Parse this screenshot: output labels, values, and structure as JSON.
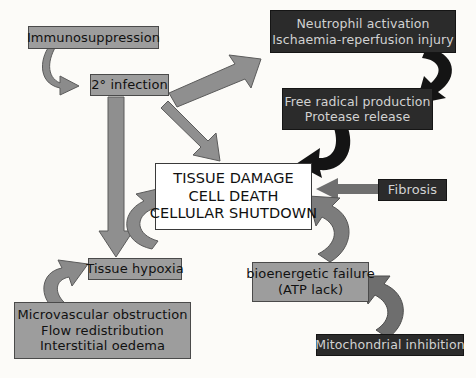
{
  "diagram": {
    "colors": {
      "grey_fill": "#9d9d9d",
      "grey_stroke": "#4a4a4a",
      "dark_fill": "#2b2b2b",
      "dark_text": "#d2d2d2",
      "white_fill": "#ffffff",
      "black_arrow": "#1a1a1a",
      "grey_arrow": "#8f8f8f",
      "page_background": "#fcfbf8"
    },
    "nodes": [
      {
        "id": "immunosuppression",
        "style": "grey",
        "lines": [
          "Immunosuppression"
        ]
      },
      {
        "id": "secondary-infection",
        "style": "grey",
        "lines": [
          "2° infection"
        ]
      },
      {
        "id": "neutrophil-activation",
        "style": "dark",
        "lines": [
          "Neutrophil activation",
          "Ischaemia-reperfusion injury"
        ]
      },
      {
        "id": "free-radical-production",
        "style": "dark",
        "lines": [
          "Free radical production",
          "Protease release"
        ]
      },
      {
        "id": "fibrosis",
        "style": "dark",
        "lines": [
          "Fibrosis"
        ]
      },
      {
        "id": "tissue-damage",
        "style": "white",
        "lines": [
          "TISSUE DAMAGE",
          "CELL DEATH",
          "CELLULAR SHUTDOWN"
        ]
      },
      {
        "id": "tissue-hypoxia",
        "style": "grey",
        "lines": [
          "Tissue hypoxia"
        ]
      },
      {
        "id": "microvascular-obstruction",
        "style": "grey",
        "lines": [
          "Microvascular obstruction",
          "Flow redistribution",
          "Interstitial oedema"
        ]
      },
      {
        "id": "bioenergetic-failure",
        "style": "grey",
        "lines": [
          "bioenergetic failure",
          "(ATP lack)"
        ]
      },
      {
        "id": "mitochondrial-inhibition",
        "style": "dark",
        "lines": [
          "Mitochondrial inhibition"
        ]
      }
    ],
    "edges": [
      {
        "id": "immunosuppression-to-infection",
        "from": "immunosuppression",
        "to": "secondary-infection",
        "shape": "curved",
        "color": "grey"
      },
      {
        "id": "infection-to-neutrophil",
        "from": "secondary-infection",
        "to": "neutrophil-activation",
        "shape": "straight",
        "color": "grey"
      },
      {
        "id": "infection-to-tissue-damage",
        "from": "secondary-infection",
        "to": "tissue-damage",
        "shape": "straight",
        "color": "grey"
      },
      {
        "id": "infection-to-hypoxia",
        "from": "secondary-infection",
        "to": "tissue-hypoxia",
        "shape": "straight",
        "color": "grey"
      },
      {
        "id": "neutrophil-to-free-radical",
        "from": "neutrophil-activation",
        "to": "free-radical-production",
        "shape": "curved",
        "color": "black"
      },
      {
        "id": "free-radical-to-tissue-damage",
        "from": "free-radical-production",
        "to": "tissue-damage",
        "shape": "curved",
        "color": "black"
      },
      {
        "id": "fibrosis-to-tissue-damage",
        "from": "fibrosis",
        "to": "tissue-damage",
        "shape": "straight",
        "color": "grey"
      },
      {
        "id": "microvascular-to-hypoxia",
        "from": "microvascular-obstruction",
        "to": "tissue-hypoxia",
        "shape": "curved",
        "color": "grey"
      },
      {
        "id": "hypoxia-to-tissue-damage",
        "from": "tissue-hypoxia",
        "to": "tissue-damage",
        "shape": "curved",
        "color": "grey"
      },
      {
        "id": "mitochondrial-to-bioenergetic",
        "from": "mitochondrial-inhibition",
        "to": "bioenergetic-failure",
        "shape": "curved",
        "color": "grey"
      },
      {
        "id": "bioenergetic-to-tissue-damage",
        "from": "bioenergetic-failure",
        "to": "tissue-damage",
        "shape": "curved",
        "color": "grey"
      }
    ]
  }
}
